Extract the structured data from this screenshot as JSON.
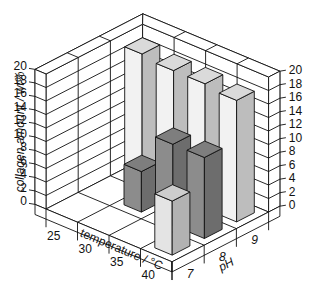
{
  "chart_data": {
    "type": "bar3d",
    "title": "",
    "zlabel": "collagen amount / wt%",
    "xlabel": "temperature / °C",
    "ylabel": "pH",
    "x_categories": [
      "25",
      "30",
      "35",
      "40"
    ],
    "y_categories": [
      "7",
      "8",
      "9"
    ],
    "zlim": [
      0,
      20
    ],
    "z_ticks": [
      "0",
      "2",
      "4",
      "6",
      "8",
      "10",
      "12",
      "14",
      "16",
      "18",
      "20"
    ],
    "grid": true,
    "series": [
      {
        "name": "pH 7",
        "color": "#e4e4e4",
        "values": [
          null,
          null,
          null,
          8
        ]
      },
      {
        "name": "pH 8",
        "color": "#8c8c8c",
        "values": [
          null,
          6,
          12,
          12
        ]
      },
      {
        "name": "pH 9",
        "color": "#f2f2f2",
        "values": [
          19,
          18.5,
          18.5,
          18
        ]
      }
    ]
  },
  "labels": {
    "zlabel": "collagen amount / wt%",
    "xlabel_text": "temperature / °C",
    "ylabel_text": "pH"
  }
}
